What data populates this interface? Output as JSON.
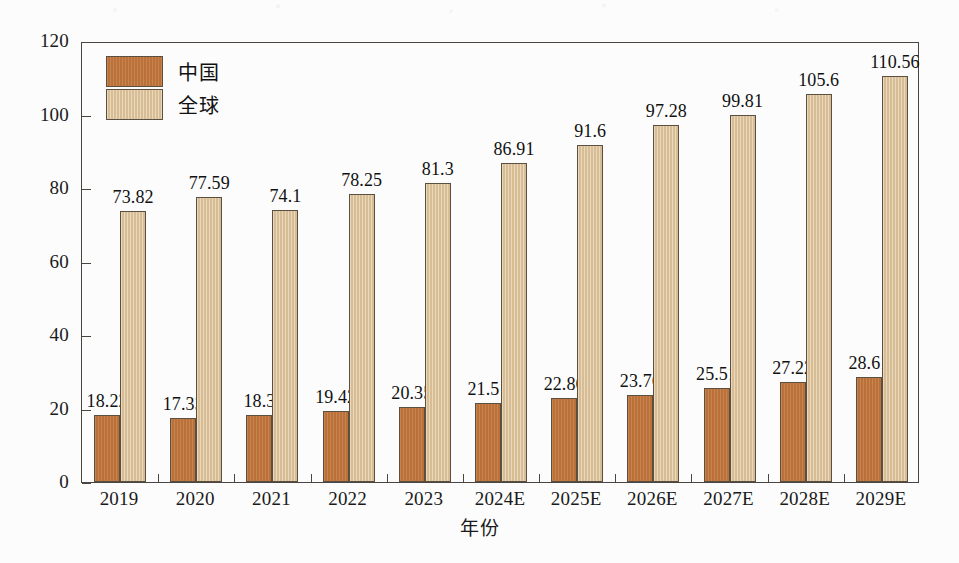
{
  "chart_data": {
    "type": "bar",
    "title": "",
    "xlabel": "年份",
    "ylabel": "TNT产量（×10⁴ t）",
    "ylim": [
      0,
      120
    ],
    "ytick_step": 20,
    "yticks": [
      "0",
      "20",
      "40",
      "60",
      "80",
      "100",
      "120"
    ],
    "grid": false,
    "legend_position": "top-left",
    "categories": [
      "2019",
      "2020",
      "2021",
      "2022",
      "2023",
      "2024E",
      "2025E",
      "2026E",
      "2027E",
      "2028E",
      "2029E"
    ],
    "series": [
      {
        "name": "中国",
        "color": "#c2763c",
        "values": [
          18.22,
          17.33,
          18.3,
          19.42,
          20.35,
          21.51,
          22.86,
          23.76,
          25.51,
          27.22,
          28.61
        ],
        "labels": [
          "18.22",
          "17.33",
          "18.3",
          "19.42",
          "20.35",
          "21.51",
          "22.86",
          "23.76",
          "25.51",
          "27.22",
          "28.61"
        ]
      },
      {
        "name": "全球",
        "color": "#e2c79d",
        "values": [
          73.82,
          77.59,
          74.1,
          78.25,
          81.3,
          86.91,
          91.6,
          97.28,
          99.81,
          105.6,
          110.56
        ],
        "labels": [
          "73.82",
          "77.59",
          "74.1",
          "78.25",
          "81.3",
          "86.91",
          "91.6",
          "97.28",
          "99.81",
          "105.6",
          "110.56"
        ]
      }
    ]
  },
  "legend": {
    "items": [
      {
        "label": "中国",
        "color": "#c2763c"
      },
      {
        "label": "全球",
        "color": "#e2c79d"
      }
    ]
  },
  "axes": {
    "y_title": "TNT产量（×10⁴ t）",
    "y_title_prefix": "TNT",
    "y_title_cjk": "产量",
    "y_title_suffix": "（×10⁴ t）",
    "x_title": "年份"
  },
  "colors": {
    "china_bar": "#c2763c",
    "global_bar": "#e2c79d",
    "axis": "#4a4540",
    "bar_border": "#5a4f41",
    "text": "#111111",
    "background": "#fcfcfc"
  }
}
